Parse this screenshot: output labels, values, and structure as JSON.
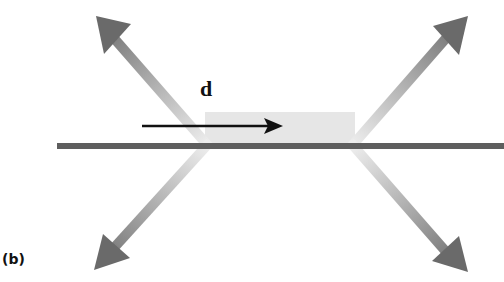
{
  "figure": {
    "panel_label": "(b)",
    "displacement_label": "d",
    "colors": {
      "background": "#ffffff",
      "surface_line": "#5e5e5e",
      "block_fill": "#e6e6e6",
      "force_arrow_head": "#6a6a6a",
      "force_arrow_fade": "#e8e8e8",
      "displacement_arrow": "#111111"
    },
    "elements": [
      {
        "name": "surface-line",
        "description": "horizontal gray line across figure"
      },
      {
        "name": "block",
        "description": "light gray rectangle resting on line"
      },
      {
        "name": "displacement-arrow",
        "direction": "right",
        "label": "d"
      },
      {
        "name": "force-arrow-upper-left",
        "direction": "up-left"
      },
      {
        "name": "force-arrow-upper-right",
        "direction": "up-right"
      },
      {
        "name": "force-arrow-lower-left",
        "direction": "down-left"
      },
      {
        "name": "force-arrow-lower-right",
        "direction": "down-right"
      }
    ]
  }
}
